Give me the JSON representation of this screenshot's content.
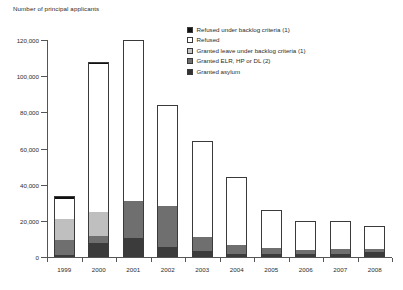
{
  "chart_data": {
    "type": "bar",
    "stacked": true,
    "title": "Number of principal applicants",
    "xlabel": "",
    "ylabel": "Number of principal applicants",
    "ylim": [
      0,
      120000
    ],
    "ytick_values": [
      0,
      20000,
      40000,
      60000,
      80000,
      100000,
      120000
    ],
    "ytick_labels": [
      "0",
      "20,000",
      "40,000",
      "60,000",
      "80,000",
      "100,000",
      "120,000"
    ],
    "grid": false,
    "legend_position": "top-right",
    "categories": [
      "1999",
      "2000",
      "2001",
      "2002",
      "2003",
      "2004",
      "2005",
      "2006",
      "2007",
      "2008"
    ],
    "series": [
      {
        "name": "Granted asylum",
        "color": "#3b3b3b",
        "values": [
          900,
          8000,
          10500,
          5500,
          3500,
          1800,
          1500,
          1500,
          1700,
          2500
        ]
      },
      {
        "name": "Granted ELR, HP or DL (2)",
        "color": "#6f6f6f",
        "values": [
          8500,
          3500,
          20500,
          22500,
          7500,
          4700,
          3500,
          2500,
          2500,
          2000
        ]
      },
      {
        "name": "Granted leave under backlog criteria (1)",
        "color": "#bfbfbf",
        "values": [
          11500,
          13500,
          0,
          0,
          0,
          0,
          0,
          0,
          0,
          0
        ]
      },
      {
        "name": "Refused",
        "color": "#ffffff",
        "values": [
          11000,
          81500,
          89000,
          56000,
          53000,
          37500,
          21000,
          16000,
          15800,
          12500
        ]
      },
      {
        "name": "Refused under backlog criteria (1)",
        "color": "#111111",
        "values": [
          1600,
          1500,
          0,
          0,
          0,
          0,
          0,
          0,
          0,
          0
        ]
      }
    ],
    "totals": [
      33500,
      108000,
      120000,
      84000,
      64000,
      44000,
      26000,
      20000,
      20000,
      17000
    ],
    "legend": [
      {
        "label": "Refused under backlog criteria (1)",
        "swatch": "refused-backlog"
      },
      {
        "label": "Refused",
        "swatch": "refused"
      },
      {
        "label": "Granted leave under backlog criteria (1)",
        "swatch": "granted-leave-backlog"
      },
      {
        "label": "Granted ELR, HP or DL (2)",
        "swatch": "granted-elr"
      },
      {
        "label": "Granted asylum",
        "swatch": "granted-asylum"
      }
    ]
  }
}
